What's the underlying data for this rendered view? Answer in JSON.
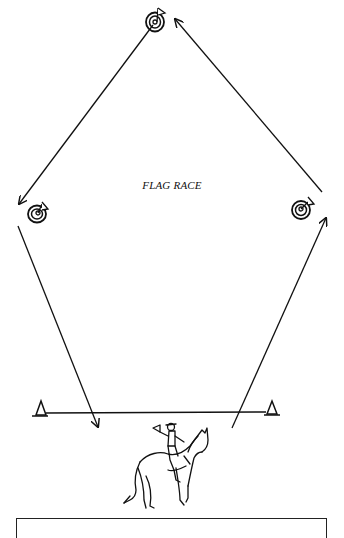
{
  "diagram": {
    "title": "FLAG RACE",
    "colors": {
      "ink": "#111111",
      "background": "#ffffff"
    },
    "nodes": [
      {
        "id": "flag-barrel-top",
        "type": "barrel-with-flag",
        "x": 155,
        "y": 22
      },
      {
        "id": "flag-barrel-left",
        "type": "barrel-with-flag",
        "x": 38,
        "y": 213
      },
      {
        "id": "flag-barrel-right",
        "type": "barrel-with-flag",
        "x": 301,
        "y": 210
      },
      {
        "id": "cone-left",
        "type": "start-finish-marker",
        "x": 40,
        "y": 413
      },
      {
        "id": "cone-right",
        "type": "start-finish-marker",
        "x": 272,
        "y": 413
      },
      {
        "id": "horse-and-rider",
        "type": "illustration",
        "x": 165,
        "y": 465
      }
    ],
    "edges": [
      {
        "from": "cone-right",
        "to": "flag-barrel-right",
        "direction": "up",
        "arrow": true
      },
      {
        "from": "flag-barrel-right",
        "to": "flag-barrel-top",
        "direction": "up-left",
        "arrow": true
      },
      {
        "from": "flag-barrel-top",
        "to": "flag-barrel-left",
        "direction": "down-left",
        "arrow": true
      },
      {
        "from": "flag-barrel-left",
        "to": "cone-left",
        "direction": "down",
        "arrow": true
      }
    ],
    "start_line": {
      "from": "cone-left",
      "to": "cone-right"
    },
    "caption": ""
  }
}
